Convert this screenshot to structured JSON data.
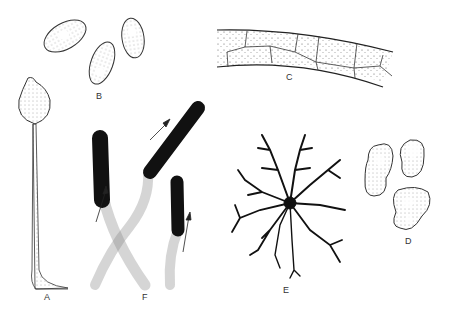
{
  "figure": {
    "panels": [
      {
        "id": "A",
        "label": "A",
        "description": "stalked sporangium"
      },
      {
        "id": "B",
        "label": "B",
        "description": "three oval spores with vacuole"
      },
      {
        "id": "C",
        "label": "C",
        "description": "curved cellular band with polygonal cells"
      },
      {
        "id": "D",
        "label": "D",
        "description": "three irregular stippled cells"
      },
      {
        "id": "E",
        "label": "E",
        "description": "branched radiating dendritic cell"
      },
      {
        "id": "F",
        "label": "F",
        "description": "hyphae with dark tips and growth arrows"
      }
    ],
    "colors": {
      "ink": "#1a1a1a",
      "stipple": "#777777",
      "background": "#ffffff"
    }
  }
}
